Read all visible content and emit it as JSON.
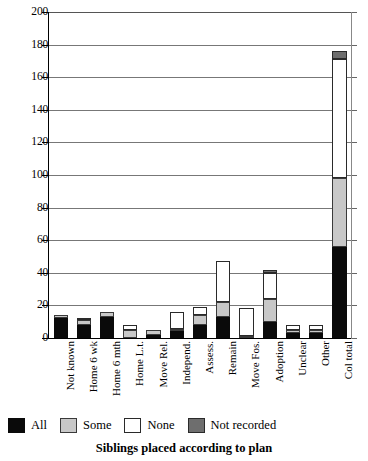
{
  "chart_data": {
    "type": "bar",
    "subtype": "stacked-vertical",
    "title": "Siblings placed according to plan",
    "title_position": "bottom",
    "xlabel": "",
    "ylabel": "",
    "ylim": [
      0,
      200
    ],
    "ytick_step": 20,
    "yticks": [
      0,
      20,
      40,
      60,
      80,
      100,
      120,
      140,
      160,
      180,
      200
    ],
    "ytick_labels": [
      "0",
      "20",
      "40",
      "60",
      "80",
      "100",
      "120",
      "140",
      "160",
      "180",
      "200"
    ],
    "grid": true,
    "grid_axis": "y",
    "legend_position": "bottom",
    "categories": [
      "Not known",
      "Home 6 wk",
      "Home 6 mth",
      "Home L.t.",
      "Move Rel.",
      "Independ.",
      "Assess.",
      "Remain",
      "Move Fos.",
      "Adoption",
      "Unclear",
      "Other",
      "Col total"
    ],
    "series": [
      {
        "name": "All",
        "color": "#0a0a0a",
        "values": [
          12,
          8,
          13,
          0,
          2,
          4,
          8,
          13,
          0,
          10,
          3,
          3,
          56
        ]
      },
      {
        "name": "Some",
        "color": "#c8c8c8",
        "values": [
          2,
          3,
          3,
          5,
          3,
          1,
          6,
          9,
          1,
          14,
          2,
          2,
          42
        ]
      },
      {
        "name": "None",
        "color": "#ffffff",
        "values": [
          0,
          1,
          0,
          3,
          0,
          11,
          5,
          25,
          17,
          16,
          3,
          3,
          73
        ]
      },
      {
        "name": "Not recorded",
        "color": "#6e6e6e",
        "values": [
          0,
          0,
          0,
          0,
          0,
          0,
          0,
          0,
          0,
          2,
          0,
          0,
          5
        ]
      }
    ],
    "totals": [
      14,
      12,
      16,
      8,
      5,
      16,
      19,
      47,
      18,
      42,
      8,
      8,
      176
    ]
  },
  "legend": {
    "items": [
      {
        "label": "All",
        "swatch": "black-swatch"
      },
      {
        "label": "Some",
        "swatch": "light-gray-swatch"
      },
      {
        "label": "None",
        "swatch": "white-swatch"
      },
      {
        "label": "Not recorded",
        "swatch": "dark-gray-swatch"
      }
    ]
  }
}
